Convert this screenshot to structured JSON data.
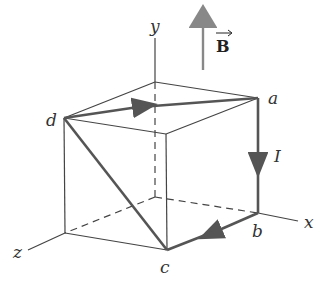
{
  "diagram": {
    "type": "cube-current-loop-in-magnetic-field",
    "axes": {
      "x": "x",
      "y": "y",
      "z": "z"
    },
    "vertices": {
      "a": "a",
      "b": "b",
      "c": "c",
      "d": "d"
    },
    "current_label": "I",
    "field_label": "B",
    "colors": {
      "edge": "#444444",
      "path": "#555555",
      "field_arrow": "#888888"
    }
  }
}
